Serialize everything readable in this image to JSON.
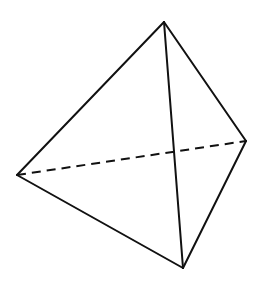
{
  "diagram": {
    "background": "#ffffff",
    "stroke_color": "#111111",
    "stroke_width": 2,
    "dash_pattern": [
      9,
      6
    ],
    "vertices": {
      "top": {
        "x": 164,
        "y": 22
      },
      "left": {
        "x": 17,
        "y": 175
      },
      "right": {
        "x": 246,
        "y": 141
      },
      "bottom": {
        "x": 183,
        "y": 268
      }
    },
    "edges": [
      {
        "id": "top-left",
        "from": "top",
        "to": "left",
        "style": "solid"
      },
      {
        "id": "top-right",
        "from": "top",
        "to": "right",
        "style": "solid"
      },
      {
        "id": "top-bottom",
        "from": "top",
        "to": "bottom",
        "style": "solid"
      },
      {
        "id": "left-bottom",
        "from": "left",
        "to": "bottom",
        "style": "solid"
      },
      {
        "id": "right-bottom",
        "from": "right",
        "to": "bottom",
        "style": "solid"
      },
      {
        "id": "left-right",
        "from": "left",
        "to": "right",
        "style": "dashed"
      }
    ]
  }
}
